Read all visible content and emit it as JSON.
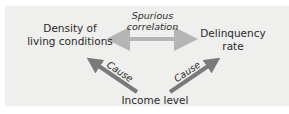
{
  "diagram": {
    "nodes": [
      {
        "id": "density",
        "label_line1": "Density of",
        "label_line2": "living conditions"
      },
      {
        "id": "delinquency",
        "label_line1": "Delinquency",
        "label_line2": "rate"
      },
      {
        "id": "income",
        "label": "Income level"
      }
    ],
    "edges": [
      {
        "from": "density",
        "to": "delinquency",
        "label_line1": "Spurious",
        "label_line2": "correlation",
        "style": "double-headed",
        "color": "#b5b5b5"
      },
      {
        "from": "income",
        "to": "density",
        "label": "Cause",
        "color": "#7a7a7a"
      },
      {
        "from": "income",
        "to": "delinquency",
        "label": "Cause",
        "color": "#7a7a7a"
      }
    ],
    "colors": {
      "panel_background": "#efefee",
      "text": "#2a2a2a",
      "correlation_arrow": "#b5b5b5",
      "cause_arrow": "#7a7a7a"
    }
  }
}
